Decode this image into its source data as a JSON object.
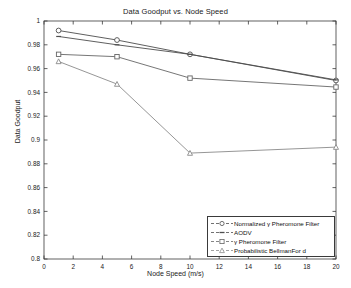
{
  "chart_data": {
    "type": "line",
    "title": "Data Goodput vs. Node Speed",
    "xlabel": "Node Speed (m/s)",
    "ylabel": "Data Goodput",
    "x": [
      1,
      5,
      10,
      20
    ],
    "xlim": [
      0,
      20
    ],
    "ylim": [
      0.8,
      1
    ],
    "xticks": [
      0,
      2,
      4,
      6,
      8,
      10,
      12,
      14,
      16,
      18,
      20
    ],
    "xticklabels": [
      "0",
      "2",
      "4",
      "6",
      "8",
      "10",
      "12",
      "14",
      "16",
      "18",
      "20"
    ],
    "yticks": [
      0.8,
      0.82,
      0.84,
      0.86,
      0.88,
      0.9,
      0.92,
      0.94,
      0.96,
      0.98,
      1
    ],
    "yticklabels": [
      "0.8",
      "0.82",
      "0.84",
      "0.86",
      "0.88",
      "0.9",
      "0.92",
      "0.94",
      "0.96",
      "0.98",
      "1"
    ],
    "grid": false,
    "legend_position": "lower right",
    "series": [
      {
        "name": "Normalized γ Pheromone Filter",
        "marker": "circle",
        "color": "#4d4d4d",
        "values": [
          0.992,
          0.984,
          0.972,
          0.95
        ]
      },
      {
        "name": "AODV",
        "marker": "dash",
        "color": "#4d4d4d",
        "values": [
          0.987,
          0.98,
          0.972,
          0.9505
        ]
      },
      {
        "name": "γ Pheromone Filter",
        "marker": "square",
        "color": "#666666",
        "values": [
          0.972,
          0.97,
          0.952,
          0.9445
        ]
      },
      {
        "name": "Probabilistic BellmanFor d",
        "marker": "triangle",
        "color": "#8a8a8a",
        "values": [
          0.966,
          0.947,
          0.889,
          0.894
        ]
      }
    ]
  },
  "legend": {
    "entries": [
      "Normalized γ Pheromone Filter",
      "AODV",
      "γ Pheromone Filter",
      "Probabilistic BellmanFor d"
    ]
  }
}
